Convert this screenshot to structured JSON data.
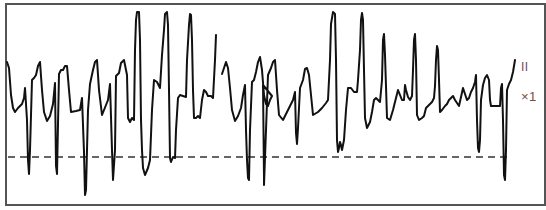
{
  "chart_data": {
    "type": "line",
    "title": "",
    "xlabel": "",
    "ylabel": "",
    "lead": "II",
    "gain": "×1",
    "grid": false,
    "legend": "none",
    "baseline_dashed_y": 157,
    "frame": {
      "x": 6,
      "y": 4,
      "width": 539,
      "height": 201
    },
    "colors": {
      "trace": "#111111",
      "frame": "#555555",
      "baseline": "#333333",
      "label": "#555555"
    },
    "segments": [
      {
        "points": [
          [
            7,
            62
          ],
          [
            9,
            68
          ],
          [
            11,
            95
          ],
          [
            13,
            108
          ],
          [
            15,
            112
          ],
          [
            18,
            108
          ],
          [
            22,
            104
          ],
          [
            24,
            98
          ],
          [
            25,
            88
          ],
          [
            27,
            120
          ],
          [
            28,
            160
          ],
          [
            29,
            174
          ],
          [
            30,
            150
          ],
          [
            32,
            80
          ],
          [
            34,
            78
          ],
          [
            36,
            75
          ],
          [
            38,
            66
          ],
          [
            40,
            62
          ],
          [
            42,
            90
          ],
          [
            44,
            112
          ],
          [
            47,
            121
          ],
          [
            50,
            116
          ],
          [
            53,
            104
          ],
          [
            55,
            83
          ],
          [
            56,
            166
          ],
          [
            57,
            174
          ],
          [
            59,
            74
          ],
          [
            61,
            70
          ],
          [
            63,
            70
          ],
          [
            65,
            66
          ],
          [
            67,
            66
          ],
          [
            69,
            90
          ],
          [
            71,
            112
          ],
          [
            76,
            111
          ],
          [
            80,
            110
          ],
          [
            82,
            98
          ],
          [
            84,
            152
          ],
          [
            85,
            195
          ],
          [
            86,
            190
          ],
          [
            88,
            110
          ],
          [
            90,
            84
          ],
          [
            93,
            70
          ],
          [
            95,
            62
          ],
          [
            97,
            60
          ],
          [
            99,
            90
          ],
          [
            102,
            115
          ],
          [
            106,
            105
          ],
          [
            108,
            100
          ],
          [
            110,
            84
          ],
          [
            112,
            150
          ],
          [
            113,
            180
          ],
          [
            115,
            150
          ],
          [
            116,
            76
          ],
          [
            119,
            73
          ],
          [
            121,
            63
          ],
          [
            124,
            60
          ],
          [
            127,
            75
          ],
          [
            128,
            118
          ],
          [
            130,
            122
          ],
          [
            132,
            118
          ],
          [
            134,
            120
          ],
          [
            135,
            50
          ],
          [
            136,
            20
          ],
          [
            137,
            12
          ],
          [
            139,
            12
          ],
          [
            140,
            40
          ],
          [
            141,
            120
          ],
          [
            142,
            150
          ],
          [
            143,
            168
          ],
          [
            145,
            175
          ],
          [
            148,
            168
          ],
          [
            150,
            160
          ],
          [
            152,
            110
          ],
          [
            154,
            80
          ],
          [
            157,
            82
          ],
          [
            160,
            88
          ],
          [
            162,
            55
          ],
          [
            164,
            30
          ],
          [
            165,
            14
          ],
          [
            167,
            12
          ],
          [
            168,
            25
          ],
          [
            169,
            90
          ],
          [
            170,
            158
          ],
          [
            171,
            162
          ],
          [
            173,
            157
          ],
          [
            175,
            158
          ],
          [
            176,
            130
          ],
          [
            178,
            98
          ],
          [
            180,
            95
          ],
          [
            183,
            96
          ],
          [
            186,
            97
          ],
          [
            187,
            60
          ],
          [
            189,
            25
          ],
          [
            190,
            14
          ],
          [
            191,
            15
          ],
          [
            192,
            40
          ],
          [
            193,
            90
          ],
          [
            194,
            118
          ],
          [
            196,
            118
          ],
          [
            198,
            116
          ],
          [
            200,
            118
          ],
          [
            202,
            100
          ],
          [
            204,
            90
          ],
          [
            206,
            92
          ],
          [
            208,
            96
          ],
          [
            211,
            96
          ],
          [
            213,
            98
          ],
          [
            215,
            60
          ],
          [
            216,
            35
          ]
        ]
      },
      {
        "points": [
          [
            222,
            74
          ],
          [
            224,
            68
          ],
          [
            226,
            62
          ],
          [
            228,
            68
          ],
          [
            230,
            88
          ],
          [
            232,
            110
          ],
          [
            235,
            121
          ],
          [
            238,
            116
          ],
          [
            241,
            108
          ],
          [
            243,
            95
          ],
          [
            245,
            85
          ],
          [
            246,
            130
          ],
          [
            247,
            160
          ],
          [
            248,
            178
          ],
          [
            249,
            180
          ],
          [
            250,
            130
          ],
          [
            252,
            82
          ],
          [
            254,
            80
          ],
          [
            256,
            72
          ],
          [
            258,
            62
          ],
          [
            260,
            57
          ],
          [
            262,
            70
          ],
          [
            264,
            95
          ],
          [
            266,
            104
          ],
          [
            268,
            106
          ],
          [
            270,
            100
          ],
          [
            272,
            96
          ],
          [
            263,
            85
          ],
          [
            264,
            178
          ],
          [
            264,
            185
          ],
          [
            266,
            130
          ],
          [
            268,
            75
          ],
          [
            271,
            68
          ],
          [
            273,
            62
          ],
          [
            275,
            60
          ],
          [
            277,
            90
          ],
          [
            279,
            115
          ],
          [
            283,
            120
          ],
          [
            287,
            112
          ],
          [
            291,
            104
          ],
          [
            293,
            100
          ],
          [
            295,
            92
          ],
          [
            296,
            133
          ],
          [
            297,
            144
          ],
          [
            298,
            128
          ],
          [
            300,
            88
          ],
          [
            303,
            80
          ],
          [
            305,
            69
          ],
          [
            307,
            68
          ],
          [
            309,
            75
          ],
          [
            311,
            95
          ],
          [
            313,
            115
          ],
          [
            318,
            112
          ],
          [
            322,
            108
          ],
          [
            326,
            103
          ],
          [
            328,
            100
          ],
          [
            330,
            60
          ],
          [
            331,
            24
          ],
          [
            333,
            12
          ],
          [
            335,
            14
          ],
          [
            336,
            60
          ],
          [
            337,
            140
          ],
          [
            338,
            152
          ],
          [
            339,
            148
          ],
          [
            340,
            142
          ],
          [
            341,
            145
          ],
          [
            342,
            150
          ],
          [
            344,
            140
          ],
          [
            346,
            110
          ],
          [
            348,
            88
          ],
          [
            351,
            88
          ],
          [
            354,
            92
          ],
          [
            357,
            92
          ],
          [
            358,
            80
          ],
          [
            360,
            50
          ],
          [
            361,
            20
          ],
          [
            362,
            13
          ],
          [
            363,
            20
          ],
          [
            364,
            70
          ],
          [
            365,
            118
          ],
          [
            367,
            128
          ],
          [
            370,
            122
          ],
          [
            372,
            112
          ],
          [
            374,
            100
          ],
          [
            376,
            98
          ],
          [
            378,
            100
          ],
          [
            380,
            102
          ],
          [
            382,
            80
          ],
          [
            383,
            40
          ],
          [
            384,
            34
          ],
          [
            385,
            55
          ],
          [
            387,
            118
          ],
          [
            390,
            120
          ],
          [
            393,
            110
          ],
          [
            396,
            98
          ],
          [
            398,
            90
          ],
          [
            400,
            95
          ],
          [
            402,
            100
          ],
          [
            404,
            100
          ],
          [
            405,
            85
          ],
          [
            406,
            90
          ],
          [
            408,
            97
          ],
          [
            410,
            100
          ],
          [
            412,
            96
          ],
          [
            413,
            70
          ],
          [
            414,
            40
          ],
          [
            415,
            34
          ],
          [
            416,
            60
          ],
          [
            417,
            115
          ],
          [
            419,
            120
          ],
          [
            422,
            118
          ],
          [
            424,
            116
          ],
          [
            426,
            108
          ],
          [
            428,
            106
          ],
          [
            430,
            104
          ],
          [
            432,
            102
          ],
          [
            434,
            98
          ],
          [
            435,
            86
          ],
          [
            436,
            60
          ],
          [
            437,
            46
          ],
          [
            438,
            50
          ],
          [
            439,
            80
          ],
          [
            440,
            112
          ],
          [
            442,
            110
          ],
          [
            445,
            106
          ],
          [
            447,
            104
          ],
          [
            449,
            100
          ],
          [
            451,
            98
          ],
          [
            453,
            96
          ],
          [
            455,
            100
          ],
          [
            457,
            103
          ],
          [
            459,
            106
          ],
          [
            461,
            97
          ],
          [
            463,
            88
          ],
          [
            465,
            94
          ],
          [
            467,
            100
          ],
          [
            469,
            98
          ],
          [
            471,
            92
          ],
          [
            473,
            88
          ],
          [
            475,
            82
          ],
          [
            476,
            75
          ],
          [
            477,
            120
          ],
          [
            478,
            148
          ],
          [
            479,
            152
          ],
          [
            480,
            140
          ],
          [
            481,
            100
          ],
          [
            483,
            85
          ],
          [
            485,
            78
          ],
          [
            487,
            75
          ],
          [
            489,
            80
          ],
          [
            490,
            100
          ],
          [
            491,
            106
          ],
          [
            494,
            106
          ],
          [
            497,
            106
          ],
          [
            500,
            106
          ],
          [
            501,
            88
          ],
          [
            502,
            84
          ],
          [
            503,
            120
          ],
          [
            504,
            175
          ],
          [
            505,
            180
          ],
          [
            506,
            150
          ],
          [
            507,
            90
          ],
          [
            509,
            84
          ],
          [
            511,
            80
          ],
          [
            513,
            72
          ],
          [
            515,
            60
          ]
        ]
      }
    ]
  }
}
